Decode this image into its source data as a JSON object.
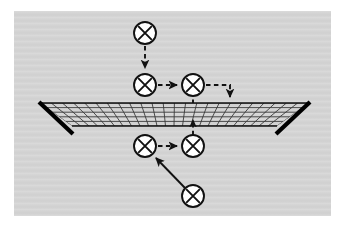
{
  "figure": {
    "background_color": "#ffffff",
    "panel_color": "#d4d4d4",
    "ink_color": "#111111",
    "panel": {
      "x": 14,
      "y": 11,
      "width": 317,
      "height": 205
    }
  },
  "mesh": {
    "name": "perspective-grid-surface",
    "label": "net",
    "top_y": 103,
    "bottom_y": 126,
    "top_left_x": 40,
    "top_right_x": 309,
    "bottom_left_x": 72,
    "bottom_right_x": 277,
    "rows": 5,
    "columns": 24,
    "line_color": "#2a2a2a",
    "edge_color": "#000000",
    "left_edge": {
      "x1": 40,
      "y1": 103,
      "x2": 72,
      "y2": 133
    },
    "right_edge": {
      "x1": 309,
      "y1": 103,
      "x2": 277,
      "y2": 133
    }
  },
  "nodes": [
    {
      "id": "n1",
      "label": "x",
      "cx": 145,
      "cy": 33,
      "r": 11
    },
    {
      "id": "n2",
      "label": "x",
      "cx": 145,
      "cy": 85,
      "r": 11
    },
    {
      "id": "n3",
      "label": "x",
      "cx": 193,
      "cy": 85,
      "r": 11
    },
    {
      "id": "n4",
      "label": "x",
      "cx": 145,
      "cy": 146,
      "r": 11
    },
    {
      "id": "n5",
      "label": "x",
      "cx": 193,
      "cy": 146,
      "r": 11
    },
    {
      "id": "n6",
      "label": "x",
      "cx": 193,
      "cy": 196,
      "r": 11
    }
  ],
  "arrows": [
    {
      "id": "a1",
      "from": "n1",
      "to": "n2",
      "style": "dashed",
      "direction": "down",
      "path": "M145,46 L145,70"
    },
    {
      "id": "a2",
      "from": "n2",
      "to": "n3",
      "style": "dashed",
      "direction": "right",
      "path": "M158,85 L179,85"
    },
    {
      "id": "a3",
      "from": "n3",
      "to": "mesh",
      "style": "dashed",
      "direction": "down-elbow",
      "path": "M206,85 L230,85 L230,100"
    },
    {
      "id": "a4",
      "from": "n4",
      "to": "n5",
      "style": "dashed",
      "direction": "right",
      "path": "M158,146 L179,146"
    },
    {
      "id": "a5",
      "from": "n5",
      "to": "mesh",
      "style": "dashed",
      "direction": "up",
      "path": "M193,134 L193,118"
    },
    {
      "id": "a6",
      "from": "mesh",
      "to": "above",
      "style": "dashed",
      "direction": "up",
      "path": "M193,103 L193,92"
    },
    {
      "id": "a7",
      "from": "n6",
      "to": "n4",
      "style": "solid",
      "direction": "up-left",
      "path": "M184,188 L155,157"
    }
  ]
}
